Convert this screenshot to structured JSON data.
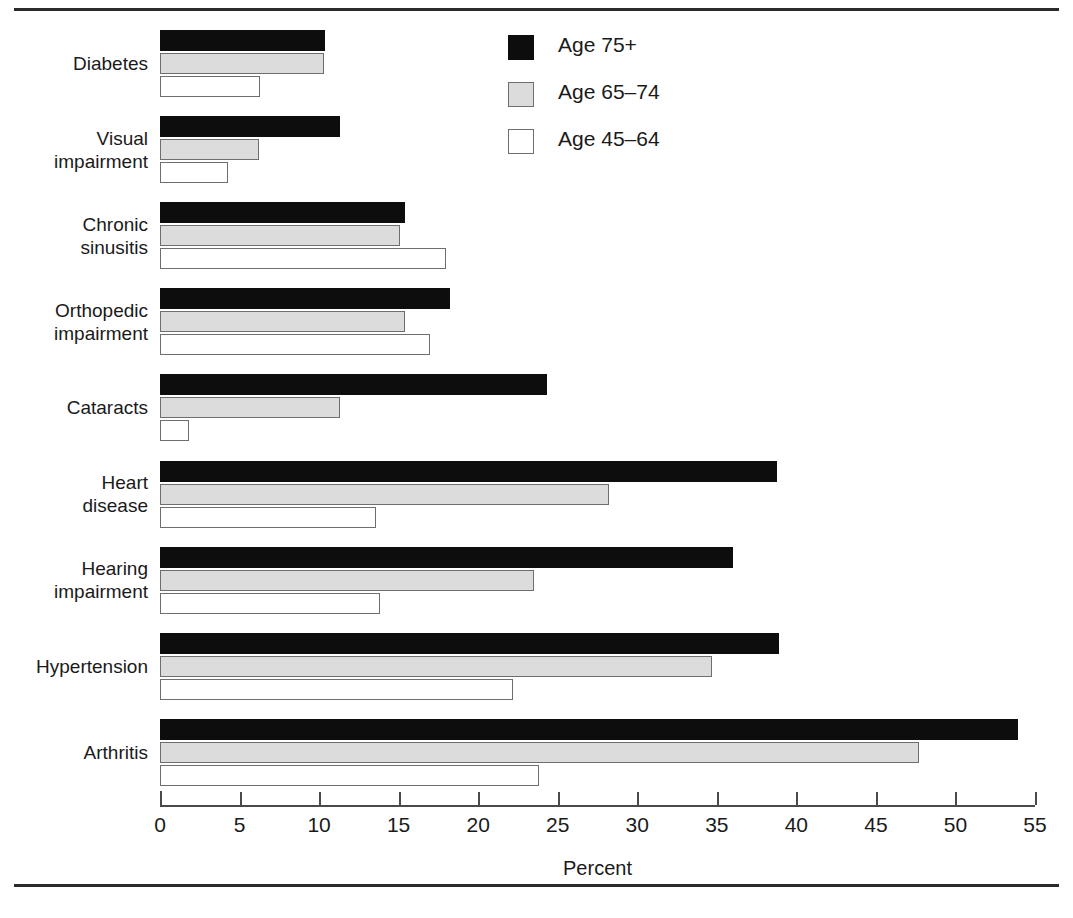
{
  "chart_data": {
    "type": "bar",
    "orientation": "horizontal",
    "title": "",
    "xlabel": "Percent",
    "ylabel": "",
    "xlim": [
      0,
      55
    ],
    "xticks": [
      0,
      5,
      10,
      15,
      20,
      25,
      30,
      35,
      40,
      45,
      50,
      55
    ],
    "xtick_labels": [
      "0",
      "5",
      "10",
      "15",
      "20",
      "25",
      "30",
      "35",
      "40",
      "45",
      "50",
      "55"
    ],
    "grid": false,
    "legend_position": "top-center",
    "categories": [
      "Diabetes",
      "Visual\nimpairment",
      "Chronic\nsinusitis",
      "Orthopedic\nimpairment",
      "Cataracts",
      "Heart\ndisease",
      "Hearing\nimpairment",
      "Hypertension",
      "Arthritis"
    ],
    "series": [
      {
        "name": "Age 75+",
        "color": "#0d0d0d",
        "values": [
          10.4,
          11.3,
          15.4,
          18.2,
          24.3,
          38.8,
          36.0,
          38.9,
          53.9
        ]
      },
      {
        "name": "Age 65–74",
        "color": "#dcdcdc",
        "values": [
          10.3,
          6.2,
          15.1,
          15.4,
          11.3,
          28.2,
          23.5,
          34.7,
          47.7
        ]
      },
      {
        "name": "Age 45–64",
        "color": "#ffffff",
        "values": [
          6.3,
          4.3,
          18.0,
          17.0,
          1.8,
          13.6,
          13.8,
          22.2,
          23.8
        ]
      }
    ]
  },
  "legend": {
    "items": [
      {
        "label": "Age 75+",
        "swatch": "black-filled-square"
      },
      {
        "label": "Age 65–74",
        "swatch": "gray-filled-square"
      },
      {
        "label": "Age 45–64",
        "swatch": "white-filled-square"
      }
    ]
  },
  "axis": {
    "xlabel": "Percent"
  }
}
